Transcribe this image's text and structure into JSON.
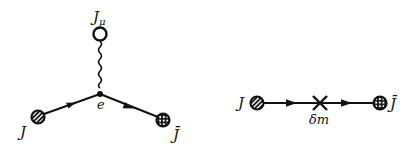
{
  "diagrams": [
    {
      "name": "vertex-diagram",
      "labels": {
        "top_source": "J",
        "top_source_sub": "μ",
        "vertex": "e",
        "left_source": "J",
        "right_source": "J̄"
      }
    },
    {
      "name": "mass-insertion-diagram",
      "labels": {
        "left_source": "J",
        "insertion": "δm",
        "right_source": "J̄"
      }
    }
  ],
  "colors": {
    "line": "#111111",
    "background": "#ffffff"
  }
}
